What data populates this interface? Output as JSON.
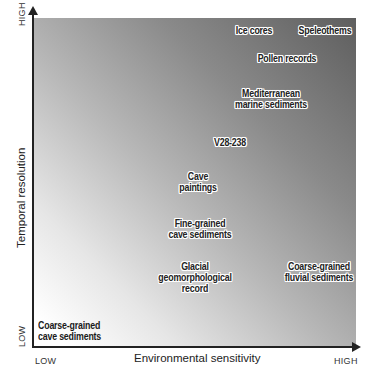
{
  "diagram": {
    "type": "scatter-quadrant",
    "x_axis": {
      "title": "Environmental sensitivity",
      "low": "LOW",
      "high": "HIGH"
    },
    "y_axis": {
      "title": "Temporal resolution",
      "low": "LOW",
      "high": "HIGH"
    },
    "background": {
      "gradient_from": "#ffffff",
      "gradient_to": "#5e5e5e",
      "direction": "bottom-left to top-right"
    },
    "items": [
      {
        "id": "ice-cores",
        "text": "Ice cores"
      },
      {
        "id": "speleothems",
        "text": "Speleothems"
      },
      {
        "id": "pollen-records",
        "text": "Pollen records"
      },
      {
        "id": "mediterranean-marine-sediments",
        "text": "Mediterranean\nmarine sediments"
      },
      {
        "id": "v28-238",
        "text": "V28-238"
      },
      {
        "id": "cave-paintings",
        "text": "Cave\npaintings"
      },
      {
        "id": "fine-grained-cave-sediments",
        "text": "Fine-grained\ncave sediments"
      },
      {
        "id": "glacial-geomorphological-record",
        "text": "Glacial\ngeomorphological\nrecord"
      },
      {
        "id": "coarse-grained-fluvial-sediments",
        "text": "Coarse-grained\nfluvial sediments"
      },
      {
        "id": "coarse-grained-cave-sediments",
        "text": "Coarse-grained\ncave sediments"
      }
    ]
  }
}
